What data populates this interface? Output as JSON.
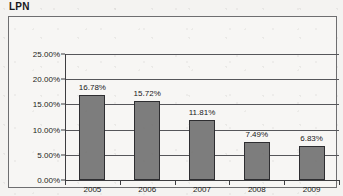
{
  "chart_data": {
    "type": "bar",
    "title": "LPN",
    "xlabel": "",
    "ylabel": "",
    "categories": [
      "2005",
      "2006",
      "2007",
      "2008",
      "2009"
    ],
    "values": [
      16.78,
      15.72,
      11.81,
      7.49,
      6.83
    ],
    "value_labels": [
      "16.78%",
      "15.72%",
      "11.81%",
      "7.49%",
      "6.83%"
    ],
    "ylim": [
      0,
      25
    ],
    "ytick_values": [
      0,
      5,
      10,
      15,
      20,
      25
    ],
    "ytick_labels": [
      "0.00%",
      "5.00%",
      "10.00%",
      "15.00%",
      "20.00%",
      "25.00%"
    ],
    "grid": true,
    "legend": false,
    "bar_color": "#7d7d7d",
    "bar_border_color": "#2e2e31",
    "axis_color": "#3d3d40",
    "grid_color": "#56565a",
    "background_color": "#f7f6f4"
  }
}
